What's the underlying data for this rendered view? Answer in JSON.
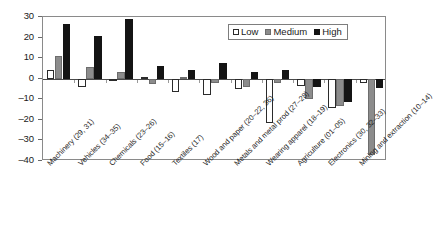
{
  "chart_data": {
    "type": "bar",
    "title": "",
    "subtitle": "",
    "xlabel": "",
    "ylabel": "",
    "ylim": [
      -40,
      30
    ],
    "ytick_step": 10,
    "yticks": [
      30,
      20,
      10,
      0,
      -10,
      -20,
      -30,
      -40
    ],
    "ytick_labels": [
      "30",
      "20",
      "10",
      "0",
      "–10",
      "–20",
      "–30",
      "–40"
    ],
    "grid": false,
    "zero_line": true,
    "legend_position": "top-right",
    "orientation": "vertical",
    "categories": [
      "Machinery (29, 31)",
      "Vehicles (34–35)",
      "Chemicals (23–26)",
      "Food (15–16)",
      "Textiles (17)",
      "Wood and paper (20–22, 36)",
      "Metals and metal prod (27–28)",
      "Wearing apparel (18–19)",
      "Agriculture (01–05)",
      "Electronics (30, 32–33)",
      "Mining and extraction (10–14)"
    ],
    "series": [
      {
        "name": "Low",
        "color": "#ffffff",
        "edge_color": "#2b2b2b",
        "values": [
          4,
          -4,
          -0.5,
          1,
          -6.5,
          -8,
          -5,
          -21.5,
          -3.5,
          -14,
          -2
        ]
      },
      {
        "name": "Medium",
        "color": "#8c8c8c",
        "edge_color": "#6d6d6d",
        "values": [
          11,
          5.5,
          3.5,
          -2.5,
          1,
          -2,
          -4,
          -2,
          -10,
          -13.5,
          -37
        ]
      },
      {
        "name": "High",
        "color": "#141414",
        "edge_color": "#141414",
        "values": [
          26.5,
          21,
          29,
          6,
          4,
          7.5,
          3.5,
          4,
          -4,
          -11.5,
          -4.5
        ]
      }
    ]
  },
  "legend": {
    "items": [
      {
        "label": "Low",
        "swatch": "low"
      },
      {
        "label": "Medium",
        "swatch": "medium"
      },
      {
        "label": "High",
        "swatch": "high"
      }
    ]
  }
}
